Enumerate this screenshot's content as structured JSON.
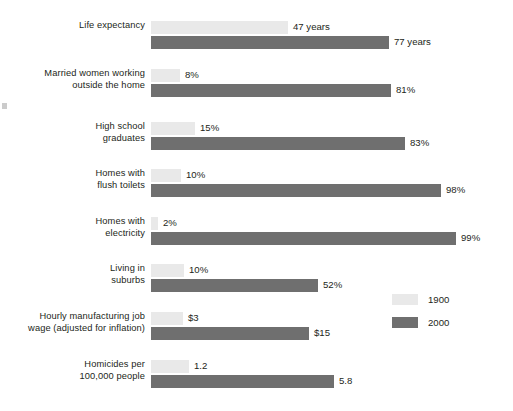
{
  "chart_data": {
    "type": "bar",
    "title": "",
    "subtitle": "",
    "xlabel": "",
    "ylabel": "",
    "orientation": "horizontal",
    "grid": false,
    "legend_position": "right-bottom",
    "scaling": "per-category proportional (each group normalized to its own larger value)",
    "categories": [
      "Life expectancy",
      "Married women working outside the home",
      "High school graduates",
      "Homes with flush toilets",
      "Homes with electricity",
      "Living in suburbs",
      "Hourly manufacturing job wage (adjusted for inflation)",
      "Homicides per 100,000 people"
    ],
    "series": [
      {
        "name": "1900",
        "color": "#e9e9e9",
        "values": [
          47,
          8,
          15,
          10,
          2,
          10,
          3,
          1.2
        ],
        "labels": [
          "47 years",
          "8%",
          "15%",
          "10%",
          "2%",
          "10%",
          "$3",
          "1.2"
        ]
      },
      {
        "name": "2000",
        "color": "#6f6f6f",
        "values": [
          77,
          81,
          83,
          98,
          99,
          52,
          15,
          5.8
        ],
        "labels": [
          "77 years",
          "81%",
          "83%",
          "98%",
          "99%",
          "52%",
          "$15",
          "5.8"
        ]
      }
    ]
  },
  "groups": [
    {
      "label_lines": [
        "Life expectancy"
      ],
      "top": 20,
      "bars": [
        {
          "series": "1900",
          "label": "47 years",
          "value": 47,
          "width_px": 137
        },
        {
          "series": "2000",
          "label": "77 years",
          "value": 77,
          "width_px": 238
        }
      ]
    },
    {
      "label_lines": [
        "Married women working",
        "outside the home"
      ],
      "top": 68,
      "bars": [
        {
          "series": "1900",
          "label": "8%",
          "value": 8,
          "width_px": 29
        },
        {
          "series": "2000",
          "label": "81%",
          "value": 81,
          "width_px": 240
        }
      ]
    },
    {
      "label_lines": [
        "High school",
        "graduates"
      ],
      "top": 121,
      "bars": [
        {
          "series": "1900",
          "label": "15%",
          "value": 15,
          "width_px": 44
        },
        {
          "series": "2000",
          "label": "83%",
          "value": 83,
          "width_px": 254
        }
      ]
    },
    {
      "label_lines": [
        "Homes with",
        "flush toilets"
      ],
      "top": 168,
      "bars": [
        {
          "series": "1900",
          "label": "10%",
          "value": 10,
          "width_px": 30
        },
        {
          "series": "2000",
          "label": "98%",
          "value": 98,
          "width_px": 290
        }
      ]
    },
    {
      "label_lines": [
        "Homes with",
        "electricity"
      ],
      "top": 216,
      "bars": [
        {
          "series": "1900",
          "label": "2%",
          "value": 2,
          "width_px": 7
        },
        {
          "series": "2000",
          "label": "99%",
          "value": 99,
          "width_px": 305
        }
      ]
    },
    {
      "label_lines": [
        "Living in",
        "suburbs"
      ],
      "top": 263,
      "bars": [
        {
          "series": "1900",
          "label": "10%",
          "value": 10,
          "width_px": 33
        },
        {
          "series": "2000",
          "label": "52%",
          "value": 52,
          "width_px": 167
        }
      ]
    },
    {
      "label_lines": [
        "Hourly manufacturing job",
        "wage (adjusted for inflation)"
      ],
      "top": 311,
      "bars": [
        {
          "series": "1900",
          "label": "$3",
          "value": 3,
          "width_px": 32
        },
        {
          "series": "2000",
          "label": "$15",
          "value": 15,
          "width_px": 158
        }
      ]
    },
    {
      "label_lines": [
        "Homicides per",
        "100,000 people"
      ],
      "top": 359,
      "bars": [
        {
          "series": "1900",
          "label": "1.2",
          "value": 1.2,
          "width_px": 38
        },
        {
          "series": "2000",
          "label": "5.8",
          "value": 5.8,
          "width_px": 183
        }
      ]
    }
  ],
  "legend": {
    "items": [
      {
        "name": "1900",
        "color": "#e9e9e9"
      },
      {
        "name": "2000",
        "color": "#6f6f6f"
      }
    ]
  },
  "colors": {
    "series_1900": "#e9e9e9",
    "series_2000": "#6f6f6f",
    "text": "#231f20",
    "background": "#ffffff"
  }
}
